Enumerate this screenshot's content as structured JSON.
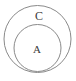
{
  "diagram": {
    "kind": "euler-diagram",
    "background_color": "#ffffff",
    "stroke_color": "#8a8a8a",
    "label_color": "#3a3a3a",
    "stroke_width": 1,
    "outer_set": {
      "label": "C",
      "cx": 37.5,
      "cy": 39,
      "r": 33.5,
      "label_x": 39,
      "label_y": 17
    },
    "inner_set": {
      "label": "A",
      "cx": 37.5,
      "cy": 48,
      "r": 23.5,
      "label_x": 37,
      "label_y": 50
    }
  }
}
